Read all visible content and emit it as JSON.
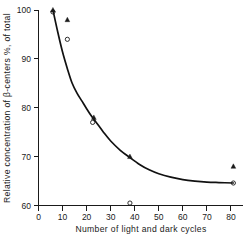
{
  "chart_data": {
    "type": "scatter",
    "title": "",
    "subtitle": "",
    "xlabel": "Number of light and dark cycles",
    "ylabel": "Relative concentration of β-centers %, of total",
    "xlim": [
      0,
      85
    ],
    "ylim": [
      60,
      100
    ],
    "xticks": [
      0,
      10,
      20,
      30,
      40,
      50,
      60,
      70,
      80
    ],
    "xticklabels": [
      "0",
      "10",
      "20",
      "30",
      "40",
      "50",
      "60",
      "70",
      "80"
    ],
    "yticks": [
      60,
      70,
      80,
      90,
      100
    ],
    "yticklabels": [
      "60",
      "70",
      "80",
      "90",
      "100"
    ],
    "grid": false,
    "legend": "none",
    "series": [
      {
        "name": "filled-triangle",
        "marker": "triangle",
        "points": [
          {
            "x": 6,
            "y": 100
          },
          {
            "x": 12,
            "y": 98
          },
          {
            "x": 23,
            "y": 78
          },
          {
            "x": 38,
            "y": 70
          },
          {
            "x": 81,
            "y": 68
          }
        ]
      },
      {
        "name": "open-circle",
        "marker": "circle",
        "points": [
          {
            "x": 6,
            "y": 99.6
          },
          {
            "x": 12,
            "y": 94
          },
          {
            "x": 22.5,
            "y": 77
          },
          {
            "x": 38,
            "y": 60.5
          },
          {
            "x": 81,
            "y": 64.6
          }
        ]
      }
    ],
    "fitted_curve": {
      "name": "exponential-decay-fit",
      "description": "smooth decaying curve from 100 at x=6 to plateau near 64.6",
      "points": [
        {
          "x": 6,
          "y": 100
        },
        {
          "x": 8,
          "y": 95.5
        },
        {
          "x": 10,
          "y": 91.4
        },
        {
          "x": 12,
          "y": 88.0
        },
        {
          "x": 14,
          "y": 85.0
        },
        {
          "x": 16,
          "y": 83.0
        },
        {
          "x": 18,
          "y": 81.4
        },
        {
          "x": 20,
          "y": 79.8
        },
        {
          "x": 22,
          "y": 78.3
        },
        {
          "x": 24,
          "y": 77.0
        },
        {
          "x": 27,
          "y": 75.0
        },
        {
          "x": 30,
          "y": 73.2
        },
        {
          "x": 34,
          "y": 71.3
        },
        {
          "x": 38,
          "y": 69.8
        },
        {
          "x": 42,
          "y": 68.4
        },
        {
          "x": 46,
          "y": 67.3
        },
        {
          "x": 50,
          "y": 66.5
        },
        {
          "x": 55,
          "y": 65.8
        },
        {
          "x": 60,
          "y": 65.3
        },
        {
          "x": 65,
          "y": 65.0
        },
        {
          "x": 70,
          "y": 64.8
        },
        {
          "x": 75,
          "y": 64.7
        },
        {
          "x": 81,
          "y": 64.6
        }
      ]
    }
  },
  "axes": {
    "x_title": "Number of light and dark cycles",
    "y_title": "Relative concentration of β-centers %, of total",
    "x_tick_labels": [
      "0",
      "10",
      "20",
      "30",
      "40",
      "50",
      "60",
      "70",
      "80"
    ],
    "y_tick_labels": [
      "60",
      "70",
      "80",
      "90",
      "100"
    ]
  },
  "colors": {
    "ink": "#1a1a1a",
    "curve": "#111111",
    "background": "#ffffff"
  }
}
